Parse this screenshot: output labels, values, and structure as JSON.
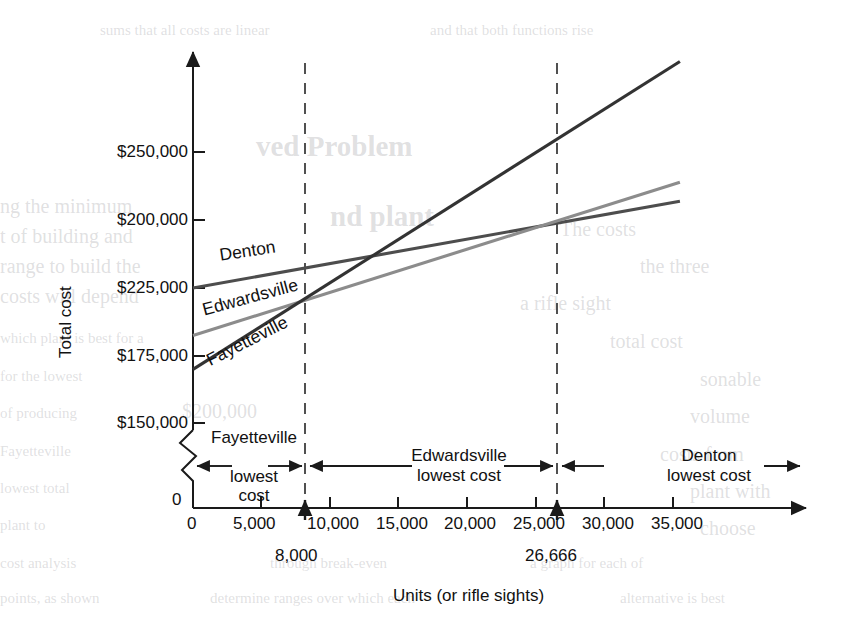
{
  "chart_data": {
    "type": "line",
    "title": "",
    "xlabel": "Units (or rifle sights)",
    "ylabel": "Total cost",
    "xlim": [
      0,
      36500
    ],
    "ylim": [
      143000,
      271000
    ],
    "grid": false,
    "legend": "inline-labels",
    "x_ticks": [
      0,
      5000,
      10000,
      15000,
      20000,
      25000,
      30000,
      35000
    ],
    "x_tick_labels": [
      "0",
      "5,000",
      "10,000",
      "15,000",
      "20,000",
      "25,000",
      "30,000",
      "35,000"
    ],
    "y_ticks": [
      150000,
      175000,
      200000,
      225000,
      250000
    ],
    "y_tick_labels": [
      "$150,000",
      "$175,000",
      "$225,000",
      "$200,000",
      "$250,000"
    ],
    "y_axis_break": true,
    "y_origin_label": "0",
    "series": [
      {
        "name": "Denton",
        "color": "#4d4d4d",
        "fixed_cost": 200000,
        "variable_cost_per_unit": 0.9,
        "points": [
          [
            0,
            200000
          ],
          [
            35500,
            232000
          ]
        ]
      },
      {
        "name": "Edwardsville",
        "color": "#8c8c8c",
        "fixed_cost": 182500,
        "variable_cost_per_unit": 1.58,
        "points": [
          [
            0,
            182500
          ],
          [
            35500,
            239000
          ]
        ]
      },
      {
        "name": "Fayetteville",
        "color": "#333333",
        "fixed_cost": 170000,
        "variable_cost_per_unit": 2.5,
        "points": [
          [
            0,
            170000
          ],
          [
            35500,
            283500
          ]
        ]
      }
    ],
    "breakeven_markers": [
      {
        "value": 8000,
        "label": "8,000"
      },
      {
        "value": 26666,
        "label": "26,666"
      }
    ],
    "zones": [
      {
        "label_line1": "Fayetteville",
        "label_line2": "lowest",
        "label_line3": "cost",
        "from": 0,
        "to": 8000
      },
      {
        "label_line1": "Edwardsville",
        "label_line2": "lowest cost",
        "label_line3": "",
        "from": 8000,
        "to": 26666
      },
      {
        "label_line1": "Denton",
        "label_line2": "lowest cost",
        "label_line3": "",
        "from": 26666,
        "to": 36500
      }
    ]
  },
  "background_bleed": [
    {
      "text": "ved Problem",
      "x": 256,
      "y": 130,
      "class": "big"
    },
    {
      "text": "nd plant",
      "x": 330,
      "y": 200,
      "class": "big"
    },
    {
      "text": "ng the minimum",
      "x": 0,
      "y": 195,
      "class": "mid"
    },
    {
      "text": "t of building and",
      "x": 0,
      "y": 225,
      "class": "mid"
    },
    {
      "text": "range to build the",
      "x": 0,
      "y": 255,
      "class": "mid"
    },
    {
      "text": "costs will depend",
      "x": 0,
      "y": 285,
      "class": "mid"
    },
    {
      "text": "$200,000",
      "x": 182,
      "y": 400,
      "class": "mid"
    },
    {
      "text": "The costs",
      "x": 560,
      "y": 218,
      "class": "mid"
    },
    {
      "text": "the three",
      "x": 640,
      "y": 255,
      "class": "mid"
    },
    {
      "text": "a rifle sight",
      "x": 520,
      "y": 292,
      "class": "mid"
    },
    {
      "text": "total cost",
      "x": 610,
      "y": 330,
      "class": "mid"
    },
    {
      "text": "sonable",
      "x": 700,
      "y": 368,
      "class": "mid"
    },
    {
      "text": "volume",
      "x": 690,
      "y": 405,
      "class": "mid"
    },
    {
      "text": "costs from",
      "x": 660,
      "y": 443,
      "class": "mid"
    },
    {
      "text": "plant with",
      "x": 690,
      "y": 480,
      "class": "mid"
    },
    {
      "text": "choose",
      "x": 700,
      "y": 517,
      "class": "mid"
    },
    {
      "text": "which plant is best for a",
      "x": 0,
      "y": 330,
      "class": "sm"
    },
    {
      "text": "for the lowest",
      "x": 0,
      "y": 368,
      "class": "sm"
    },
    {
      "text": "of producing",
      "x": 0,
      "y": 405,
      "class": "sm"
    },
    {
      "text": "Fayetteville",
      "x": 0,
      "y": 443,
      "class": "sm"
    },
    {
      "text": "lowest total",
      "x": 0,
      "y": 480,
      "class": "sm"
    },
    {
      "text": "plant to",
      "x": 0,
      "y": 517,
      "class": "sm"
    },
    {
      "text": "cost analysis",
      "x": 0,
      "y": 555,
      "class": "sm"
    },
    {
      "text": "through break-even",
      "x": 270,
      "y": 555,
      "class": "sm"
    },
    {
      "text": "a graph for each of",
      "x": 530,
      "y": 555,
      "class": "sm"
    },
    {
      "text": "points, as shown",
      "x": 0,
      "y": 590,
      "class": "sm"
    },
    {
      "text": "determine ranges over which each",
      "x": 210,
      "y": 590,
      "class": "sm"
    },
    {
      "text": "alternative is best",
      "x": 620,
      "y": 590,
      "class": "sm"
    },
    {
      "text": "sums that all costs are linear",
      "x": 100,
      "y": 22,
      "class": "sm"
    },
    {
      "text": "and that both functions rise",
      "x": 430,
      "y": 22,
      "class": "sm"
    }
  ]
}
